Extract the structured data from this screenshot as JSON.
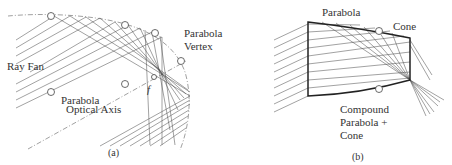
{
  "figure": {
    "panel_a": {
      "caption": "(a)",
      "labels": {
        "ray_fan": "Ray Fan",
        "vertex_line1": "Parabola",
        "vertex_line2": "Vertex",
        "axis_line1": "Parabola",
        "axis_line2": "Optical Axis",
        "focus": "f"
      }
    },
    "panel_b": {
      "caption": "(b)",
      "labels": {
        "parabola": "Parabola",
        "cone": "Cone",
        "compound_line1": "Compound",
        "compound_line2": "Parabola +",
        "compound_line3": "Cone"
      }
    },
    "colors": {
      "ink": "#333333",
      "ray": "#555555",
      "background": "#ffffff"
    }
  }
}
